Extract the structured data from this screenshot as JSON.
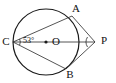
{
  "figure": {
    "type": "geometry-diagram",
    "background_color": "#ffffff",
    "stroke_color": "#1a1a1a",
    "points": [
      {
        "id": "A",
        "label": "A",
        "x": 72,
        "y": 16,
        "label_x": 76,
        "label_y": 9
      },
      {
        "id": "B",
        "label": "B",
        "x": 66,
        "y": 69,
        "label_x": 70,
        "label_y": 75
      },
      {
        "id": "C",
        "label": "C",
        "x": 13,
        "y": 42,
        "label_x": 6,
        "label_y": 42
      },
      {
        "id": "O",
        "label": "O",
        "x": 46,
        "y": 42,
        "label_x": 52,
        "label_y": 42
      },
      {
        "id": "P",
        "label": "P",
        "x": 95,
        "y": 42,
        "label_x": 101,
        "label_y": 41
      }
    ],
    "circle": {
      "center_x": 46,
      "center_y": 42,
      "radius": 33
    },
    "segments": [
      {
        "from": "C",
        "to": "A"
      },
      {
        "from": "C",
        "to": "B"
      },
      {
        "from": "C",
        "to": "P"
      },
      {
        "from": "A",
        "to": "P"
      },
      {
        "from": "B",
        "to": "P"
      }
    ],
    "angles": [
      {
        "at": "C",
        "label": "53°",
        "label_x": 23,
        "label_y": 41
      },
      {
        "at": "P",
        "label": "",
        "label_x": 0,
        "label_y": 0
      }
    ],
    "center_dot": {
      "x": 46,
      "y": 42,
      "r": 1.6
    }
  }
}
